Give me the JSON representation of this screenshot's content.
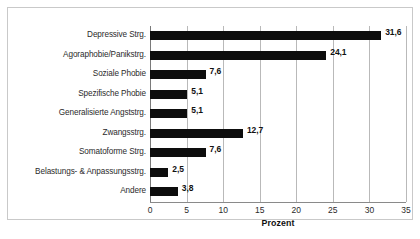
{
  "chart_data": {
    "type": "bar",
    "orientation": "horizontal",
    "title": "",
    "xlabel": "Prozent",
    "ylabel": "",
    "xlim": [
      0,
      35
    ],
    "xticks": [
      0,
      5,
      10,
      15,
      20,
      25,
      30,
      35
    ],
    "xtick_labels": [
      "0",
      "5",
      "10",
      "15",
      "20",
      "25",
      "30",
      "35"
    ],
    "grid": true,
    "legend": false,
    "bar_color": "#0d0d0d",
    "categories": [
      "Depressive Strg.",
      "Agoraphobie/Panikstrg.",
      "Soziale Phobie",
      "Spezifische Phobie",
      "Generalisierte Angststrg.",
      "Zwangsstrg.",
      "Somatoforme Strg.",
      "Belastungs- & Anpassungsstrg.",
      "Andere"
    ],
    "values": [
      31.6,
      24.1,
      7.6,
      5.1,
      5.1,
      12.7,
      7.6,
      2.5,
      3.8
    ],
    "value_labels": [
      "31,6",
      "24,1",
      "7,6",
      "5,1",
      "5,1",
      "12,7",
      "7,6",
      "2,5",
      "3,8"
    ]
  },
  "colors": {
    "bar": "#0d0d0d",
    "gridline": "#b9b9b9",
    "axis": "#8a8a8a",
    "frame": "#c9c9c9",
    "text": "#2b2b2b",
    "background": "#ffffff"
  }
}
